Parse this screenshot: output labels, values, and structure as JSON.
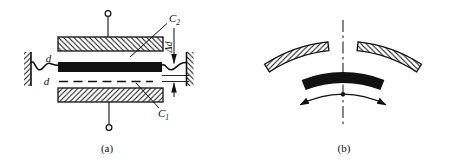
{
  "figures": {
    "a": {
      "caption": "(a)",
      "labels": {
        "c_top": {
          "base": "C",
          "sub": "2"
        },
        "c_bottom": {
          "base": "C",
          "sub": "1"
        },
        "gap_top": "d",
        "gap_bottom": "d",
        "displacement": "Δd"
      }
    },
    "b": {
      "caption": "(b)"
    }
  },
  "colors": {
    "ink": "#111111",
    "background": "#ffffff"
  }
}
